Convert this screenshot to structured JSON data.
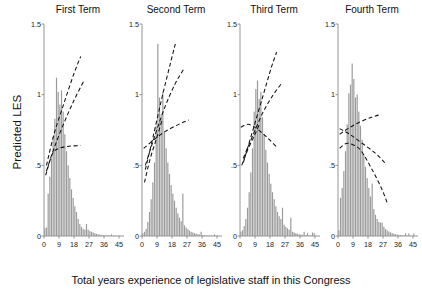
{
  "chart_data": {
    "type": "bar",
    "title": "",
    "xlabel": "Total years experience of legislative staff in this Congress",
    "ylabel": "Predicted LES",
    "xlim": [
      0,
      48
    ],
    "ylim": [
      0,
      1.5
    ],
    "grid": false,
    "legend": "none",
    "xticks": [
      "0",
      "9",
      "18",
      "27",
      "36",
      "45"
    ],
    "xtick_values": [
      0,
      9,
      18,
      27,
      36,
      45
    ],
    "yticks": [
      "0",
      ".5",
      "1",
      "1.5"
    ],
    "ytick_values": [
      0,
      0.5,
      1,
      1.5
    ],
    "panel_titles": [
      "First Term",
      "Second Term",
      "Third Term",
      "Fourth Term"
    ],
    "bar_color": "#9a9a9a",
    "line_color": "#111111",
    "line_style": "dashed",
    "bin_width": 1,
    "panels": [
      {
        "name": "First Term",
        "title": "First Term",
        "histogram": {
          "x": [
            0,
            1,
            2,
            3,
            4,
            5,
            6,
            7,
            8,
            9,
            10,
            11,
            12,
            13,
            14,
            15,
            16,
            17,
            18,
            19,
            20,
            21,
            22,
            23,
            24,
            25,
            26,
            27,
            28,
            29,
            30,
            31,
            32,
            33,
            34,
            35,
            36,
            37,
            38,
            39,
            40,
            41,
            42,
            43,
            44,
            45
          ],
          "values": [
            0.055,
            0.06,
            0.3,
            0.42,
            0.55,
            0.7,
            0.83,
            1.12,
            1.02,
            0.93,
            1.03,
            0.88,
            0.72,
            0.6,
            0.5,
            0.41,
            0.33,
            0.27,
            0.21,
            0.17,
            0.12,
            0.085,
            0.065,
            0.05,
            0.045,
            0.085,
            0.045,
            0.035,
            0.03,
            0.025,
            0.02,
            0.015,
            0.012,
            0.01,
            0.008,
            0.006,
            0.005,
            0.004,
            0.004,
            0.003,
            0.012,
            0.003,
            0.002,
            0.002,
            0.002,
            0.002
          ]
        },
        "lines": [
          {
            "name": "upper-bound",
            "points": [
              [
                1.5,
                0.5
              ],
              [
                6,
                0.72
              ],
              [
                12,
                0.94
              ],
              [
                18,
                1.15
              ],
              [
                22,
                1.27
              ]
            ]
          },
          {
            "name": "point-estimate",
            "points": [
              [
                1.5,
                0.46
              ],
              [
                6,
                0.62
              ],
              [
                12,
                0.8
              ],
              [
                18,
                0.96
              ],
              [
                24,
                1.1
              ]
            ]
          },
          {
            "name": "lower-bound",
            "points": [
              [
                1.0,
                0.43
              ],
              [
                5,
                0.58
              ],
              [
                9,
                0.62
              ],
              [
                15,
                0.635
              ],
              [
                22,
                0.64
              ]
            ]
          }
        ]
      },
      {
        "name": "Second Term",
        "title": "Second Term",
        "histogram": {
          "x": [
            0,
            1,
            2,
            3,
            4,
            5,
            6,
            7,
            8,
            9,
            10,
            11,
            12,
            13,
            14,
            15,
            16,
            17,
            18,
            19,
            20,
            21,
            22,
            23,
            24,
            25,
            26,
            27,
            28,
            29,
            30,
            31,
            32,
            33,
            34,
            35,
            36,
            37,
            38,
            39,
            40,
            41,
            42,
            43,
            44,
            45
          ],
          "values": [
            0.02,
            0.03,
            0.05,
            0.1,
            0.17,
            0.26,
            0.38,
            0.52,
            0.78,
            1.36,
            0.98,
            0.86,
            1.02,
            0.74,
            0.62,
            0.52,
            0.44,
            0.36,
            0.3,
            0.25,
            0.2,
            0.16,
            0.13,
            0.105,
            0.3,
            0.075,
            0.06,
            0.048,
            0.038,
            0.03,
            0.025,
            0.02,
            0.016,
            0.013,
            0.01,
            0.03,
            0.006,
            0.005,
            0.004,
            0.003,
            0.003,
            0.002,
            0.002,
            0.012,
            0.002,
            0.002
          ]
        },
        "lines": [
          {
            "name": "upper-bound",
            "points": [
              [
                2,
                0.47
              ],
              [
                7,
                0.72
              ],
              [
                12,
                0.98
              ],
              [
                17,
                1.22
              ],
              [
                20,
                1.36
              ]
            ]
          },
          {
            "name": "point-estimate",
            "points": [
              [
                2,
                0.5
              ],
              [
                8,
                0.72
              ],
              [
                14,
                0.92
              ],
              [
                20,
                1.08
              ],
              [
                25,
                1.18
              ]
            ]
          },
          {
            "name": "lower-bound",
            "points": [
              [
                1,
                0.62
              ],
              [
                7,
                0.68
              ],
              [
                14,
                0.74
              ],
              [
                22,
                0.79
              ],
              [
                28,
                0.82
              ]
            ]
          },
          {
            "name": "lower-ci",
            "points": [
              [
                1.5,
                0.38
              ],
              [
                5,
                0.55
              ],
              [
                9,
                0.7
              ],
              [
                12,
                0.82
              ]
            ]
          }
        ]
      },
      {
        "name": "Third Term",
        "title": "Third Term",
        "histogram": {
          "x": [
            0,
            1,
            2,
            3,
            4,
            5,
            6,
            7,
            8,
            9,
            10,
            11,
            12,
            13,
            14,
            15,
            16,
            17,
            18,
            19,
            20,
            21,
            22,
            23,
            24,
            25,
            26,
            27,
            28,
            29,
            30,
            31,
            32,
            33,
            34,
            35,
            36,
            37,
            38,
            39,
            40,
            41,
            42,
            43,
            44,
            45
          ],
          "values": [
            0.03,
            0.04,
            0.07,
            0.12,
            0.2,
            0.31,
            0.45,
            0.62,
            0.88,
            1.04,
            1.1,
            0.97,
            1.02,
            0.84,
            0.72,
            0.61,
            0.52,
            0.44,
            0.37,
            0.31,
            0.26,
            0.21,
            0.17,
            0.14,
            0.12,
            0.2,
            0.08,
            0.065,
            0.055,
            0.045,
            0.13,
            0.03,
            0.025,
            0.02,
            0.016,
            0.012,
            0.01,
            0.008,
            0.03,
            0.005,
            0.022,
            0.004,
            0.003,
            0.025,
            0.02,
            0.003
          ]
        },
        "lines": [
          {
            "name": "upper-bound",
            "points": [
              [
                2,
                0.52
              ],
              [
                8,
                0.76
              ],
              [
                14,
                1.0
              ],
              [
                19,
                1.2
              ],
              [
                22,
                1.3
              ]
            ]
          },
          {
            "name": "point-estimate",
            "points": [
              [
                2,
                0.55
              ],
              [
                8,
                0.72
              ],
              [
                14,
                0.88
              ],
              [
                20,
                1.0
              ],
              [
                25,
                1.08
              ]
            ]
          },
          {
            "name": "lower-bound",
            "points": [
              [
                0.5,
                0.77
              ],
              [
                5,
                0.79
              ],
              [
                10,
                0.76
              ],
              [
                16,
                0.7
              ],
              [
                22,
                0.63
              ]
            ]
          },
          {
            "name": "lower-ci",
            "points": [
              [
                1,
                0.5
              ],
              [
                5,
                0.62
              ],
              [
                9,
                0.72
              ],
              [
                12,
                0.8
              ]
            ]
          }
        ]
      },
      {
        "name": "Fourth Term",
        "title": "Fourth Term",
        "histogram": {
          "x": [
            0,
            1,
            2,
            3,
            4,
            5,
            6,
            7,
            8,
            9,
            10,
            11,
            12,
            13,
            14,
            15,
            16,
            17,
            18,
            19,
            20,
            21,
            22,
            23,
            24,
            25,
            26,
            27,
            28,
            29,
            30,
            31,
            32,
            33,
            34,
            35,
            36,
            37,
            38,
            39,
            40,
            41,
            42,
            43,
            44,
            45
          ],
          "values": [
            0.04,
            0.27,
            0.34,
            0.46,
            0.6,
            0.79,
            1.01,
            1.07,
            1.22,
            1.11,
            0.98,
            1.0,
            0.88,
            0.78,
            0.68,
            0.58,
            0.49,
            0.41,
            0.34,
            0.28,
            0.37,
            0.19,
            0.15,
            0.12,
            0.1,
            0.095,
            0.095,
            0.065,
            0.05,
            0.04,
            0.032,
            0.026,
            0.02,
            0.016,
            0.013,
            0.01,
            0.008,
            0.006,
            0.005,
            0.004,
            0.02,
            0.003,
            0.018,
            0.002,
            0.002,
            0.018
          ]
        },
        "lines": [
          {
            "name": "upper-bound",
            "points": [
              [
                1,
                0.72
              ],
              [
                6,
                0.76
              ],
              [
                12,
                0.8
              ],
              [
                20,
                0.84
              ],
              [
                26,
                0.86
              ]
            ]
          },
          {
            "name": "point-estimate",
            "points": [
              [
                1,
                0.76
              ],
              [
                7,
                0.72
              ],
              [
                14,
                0.66
              ],
              [
                22,
                0.59
              ],
              [
                28,
                0.52
              ]
            ]
          },
          {
            "name": "lower-bound",
            "points": [
              [
                1,
                0.62
              ],
              [
                5,
                0.655
              ],
              [
                10,
                0.64
              ],
              [
                14,
                0.6
              ],
              [
                20,
                0.48
              ],
              [
                26,
                0.34
              ],
              [
                30,
                0.22
              ]
            ]
          }
        ]
      }
    ]
  }
}
